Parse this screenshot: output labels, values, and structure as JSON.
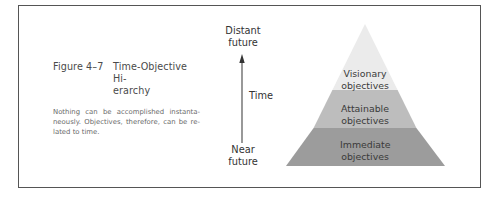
{
  "figure": {
    "number": "Figure 4–7",
    "title_line1": "Time-Objective Hi-",
    "title_line2": "erarchy",
    "description_lines": [
      "Nothing can be accomplished instanta-",
      "neously. Objectives, therefore, can be re-",
      "lated to time."
    ]
  },
  "time_axis": {
    "top_label_line1": "Distant",
    "top_label_line2": "future",
    "axis_label": "Time",
    "bottom_label_line1": "Near",
    "bottom_label_line2": "future",
    "direction": "up"
  },
  "pyramid": {
    "layers": [
      {
        "position": "top",
        "line1": "Visionary",
        "line2": "objectives",
        "color": "#ebebeb"
      },
      {
        "position": "middle",
        "line1": "Attainable",
        "line2": "objectives",
        "color": "#bdbdbd"
      },
      {
        "position": "bottom",
        "line1": "Immediate",
        "line2": "objectives",
        "color": "#9c9c9c"
      }
    ]
  },
  "colors": {
    "frame_border": "#555555",
    "arrow": "#333333",
    "text_dark": "#333333",
    "caption_body": "#6a6a6a"
  }
}
